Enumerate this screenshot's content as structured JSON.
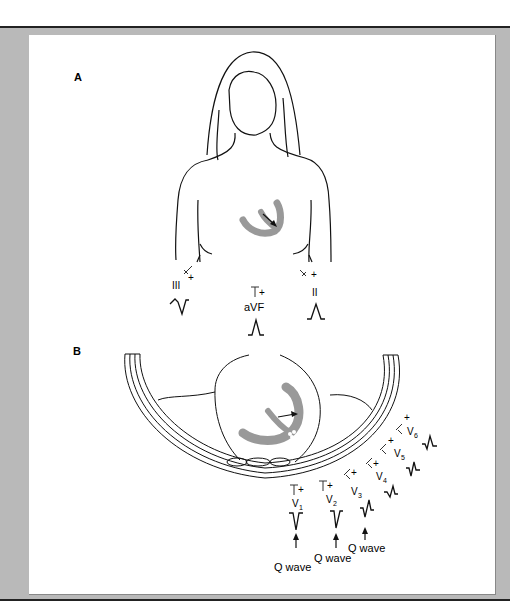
{
  "figure": {
    "panel_a_label": "A",
    "panel_b_label": "B",
    "limb_leads": [
      {
        "name": "III",
        "sign": "+",
        "wave": "negative-qrs"
      },
      {
        "name": "aVF",
        "sign": "+",
        "wave": "positive-r"
      },
      {
        "name": "II",
        "sign": "+",
        "wave": "positive-r"
      }
    ],
    "precordial_leads": [
      {
        "name": "V",
        "sub": "1",
        "sign": "+"
      },
      {
        "name": "V",
        "sub": "2",
        "sign": "+"
      },
      {
        "name": "V",
        "sub": "3",
        "sign": "+"
      },
      {
        "name": "V",
        "sub": "4",
        "sign": "+"
      },
      {
        "name": "V",
        "sub": "5",
        "sign": "+"
      },
      {
        "name": "V",
        "sub": "6",
        "sign": "+"
      }
    ],
    "annotations": [
      "Q wave",
      "Q wave",
      "Q wave"
    ],
    "colors": {
      "frame": "#b9b9b9",
      "heart": "#999999",
      "line": "#111111"
    }
  }
}
